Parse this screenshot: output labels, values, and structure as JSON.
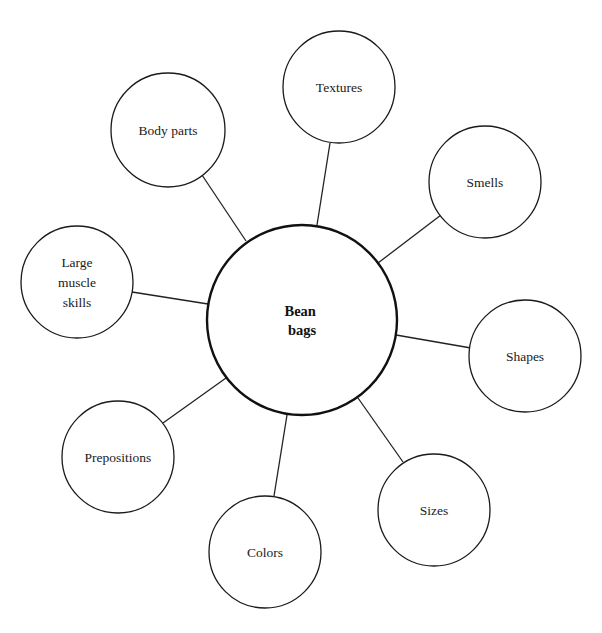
{
  "diagram": {
    "type": "concept-web",
    "center": {
      "label_lines": [
        "Bean",
        "bags"
      ],
      "cx": 302,
      "cy": 320,
      "r": 95
    },
    "nodes": [
      {
        "id": "body-parts",
        "label_lines": [
          "Body parts"
        ],
        "cx": 168,
        "cy": 130,
        "r": 57,
        "line": [
          202,
          175,
          246,
          241
        ]
      },
      {
        "id": "textures",
        "label_lines": [
          "Textures"
        ],
        "cx": 339,
        "cy": 87,
        "r": 56,
        "line": [
          330,
          143,
          317,
          225
        ]
      },
      {
        "id": "smells",
        "label_lines": [
          "Smells"
        ],
        "cx": 485,
        "cy": 182,
        "r": 56,
        "line": [
          441,
          215,
          378,
          263
        ]
      },
      {
        "id": "shapes",
        "label_lines": [
          "Shapes"
        ],
        "cx": 525,
        "cy": 356,
        "r": 56,
        "line": [
          396,
          335,
          471,
          348
        ]
      },
      {
        "id": "sizes",
        "label_lines": [
          "Sizes"
        ],
        "cx": 434,
        "cy": 510,
        "r": 56,
        "line": [
          358,
          398,
          403,
          462
        ]
      },
      {
        "id": "colors",
        "label_lines": [
          "Colors"
        ],
        "cx": 265,
        "cy": 552,
        "r": 56,
        "line": [
          287,
          415,
          274,
          496
        ]
      },
      {
        "id": "prepositions",
        "label_lines": [
          "Prepositions"
        ],
        "cx": 118,
        "cy": 457,
        "r": 56,
        "line": [
          163,
          423,
          226,
          378
        ]
      },
      {
        "id": "large-muscle-skills",
        "label_lines": [
          "Large",
          "muscle",
          "skills"
        ],
        "cx": 77,
        "cy": 282,
        "r": 56,
        "line": [
          132,
          292,
          208,
          304
        ]
      }
    ]
  },
  "colors": {
    "stroke": "#1a1a1a",
    "background": "#ffffff"
  }
}
